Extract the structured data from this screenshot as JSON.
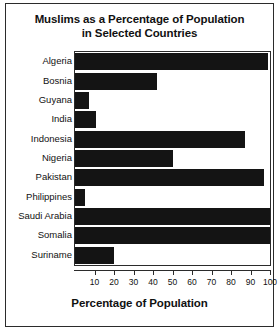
{
  "chart_data": {
    "type": "bar",
    "orientation": "horizontal",
    "title": "Muslims as a Percentage of Population in Selected Countries",
    "title_lines": [
      "Muslims as a Percentage of Population",
      "in Selected Countries"
    ],
    "xlabel": "Percentage of Population",
    "ylabel": "",
    "categories": [
      "Algeria",
      "Bosnia",
      "Guyana",
      "India",
      "Indonesia",
      "Nigeria",
      "Pakistan",
      "Philippines",
      "Saudi Arabia",
      "Somalia",
      "Suriname"
    ],
    "values": [
      99,
      42,
      7,
      11,
      87,
      50,
      97,
      5,
      100,
      100,
      20
    ],
    "xlim": [
      0,
      100
    ],
    "xticks": [
      10,
      20,
      30,
      40,
      50,
      60,
      70,
      80,
      90,
      100
    ],
    "xtick_labels": [
      "10",
      "20",
      "30",
      "40",
      "50",
      "60",
      "70",
      "80",
      "90",
      "100"
    ],
    "grid": false,
    "legend": false,
    "bar_color": "#141414",
    "frame_color": "#2b2b2b",
    "background": "#ffffff"
  }
}
